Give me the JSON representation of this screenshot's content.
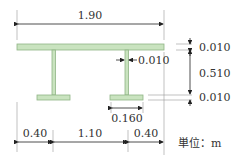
{
  "colors": {
    "member_fill": "#c9e3bf",
    "member_stroke": "#8fb486",
    "line": "#222222",
    "text": "#333333"
  },
  "dimensions": {
    "total_width": "1.90",
    "top_flange_thickness": "0.010",
    "web_thickness": "0.010",
    "web_height": "0.510",
    "bottom_flange_thickness": "0.010",
    "bottom_flange_width": "0.160",
    "left_overhang": "0.40",
    "girder_spacing": "1.10",
    "right_overhang": "0.40"
  },
  "unit_label": "単位：m"
}
